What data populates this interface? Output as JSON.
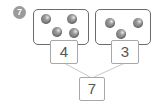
{
  "problem": {
    "number": "7"
  },
  "groups": [
    {
      "count_label": "4",
      "objects": 4
    },
    {
      "count_label": "3",
      "objects": 3
    }
  ],
  "total": {
    "label": "7"
  },
  "colors": {
    "badge": "#9a9a9a",
    "group_border": "#6b6b6b",
    "box_border": "#a8a8a8",
    "ball": "#7a7a7a",
    "connector": "#c8c8c8"
  }
}
